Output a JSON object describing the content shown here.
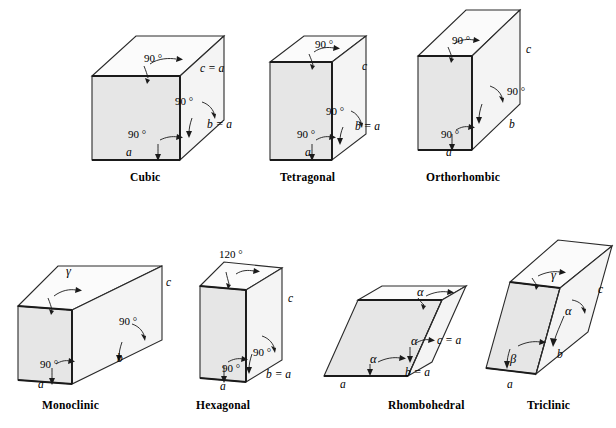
{
  "figure": {
    "background_color": "#ffffff",
    "line_color": "#2a2a2a",
    "front_face_color": "#e6e6e6",
    "top_face_color": "#fbfbfb",
    "side_face_color": "#f4f4f4"
  },
  "systems": [
    {
      "id": "cubic",
      "caption": "Cubic",
      "annotations": [
        {
          "name": "angle-top",
          "text": "90 °"
        },
        {
          "name": "angle-right",
          "text": "90 °"
        },
        {
          "name": "angle-front",
          "text": "90 °"
        },
        {
          "name": "axis-a",
          "text": "a"
        },
        {
          "name": "axis-b",
          "text": "b = a"
        },
        {
          "name": "axis-c",
          "text": "c = a"
        }
      ]
    },
    {
      "id": "tetragonal",
      "caption": "Tetragonal",
      "annotations": [
        {
          "name": "angle-top",
          "text": "90 °"
        },
        {
          "name": "angle-right",
          "text": "90 °"
        },
        {
          "name": "angle-front",
          "text": "90 °"
        },
        {
          "name": "axis-a",
          "text": "a"
        },
        {
          "name": "axis-b",
          "text": "b = a"
        },
        {
          "name": "axis-c",
          "text": "c"
        }
      ]
    },
    {
      "id": "orthorhombic",
      "caption": "Orthorhombic",
      "annotations": [
        {
          "name": "angle-top",
          "text": "90 °"
        },
        {
          "name": "angle-right",
          "text": "90 °"
        },
        {
          "name": "angle-front",
          "text": "90 °"
        },
        {
          "name": "axis-a",
          "text": "a"
        },
        {
          "name": "axis-b",
          "text": "b"
        },
        {
          "name": "axis-c",
          "text": "c"
        }
      ]
    },
    {
      "id": "monoclinic",
      "caption": "Monoclinic",
      "annotations": [
        {
          "name": "angle-top-gamma",
          "text": "γ"
        },
        {
          "name": "angle-right",
          "text": "90 °"
        },
        {
          "name": "angle-front",
          "text": "90 °"
        },
        {
          "name": "axis-a",
          "text": "a"
        },
        {
          "name": "axis-b",
          "text": "b"
        },
        {
          "name": "axis-c",
          "text": "c"
        }
      ]
    },
    {
      "id": "hexagonal",
      "caption": "Hexagonal",
      "annotations": [
        {
          "name": "angle-top",
          "text": "120 °"
        },
        {
          "name": "angle-right",
          "text": "90 °"
        },
        {
          "name": "angle-front",
          "text": "90 °"
        },
        {
          "name": "axis-a",
          "text": "a"
        },
        {
          "name": "axis-b",
          "text": "b = a"
        },
        {
          "name": "axis-c",
          "text": "c"
        }
      ]
    },
    {
      "id": "rhombohedral",
      "caption": "Rhombohedral",
      "annotations": [
        {
          "name": "angle-top-alpha",
          "text": "α"
        },
        {
          "name": "angle-mid-alpha",
          "text": "α"
        },
        {
          "name": "angle-front-alpha",
          "text": "α"
        },
        {
          "name": "axis-a",
          "text": "a"
        },
        {
          "name": "axis-b",
          "text": "b = a"
        },
        {
          "name": "axis-c",
          "text": "c = a"
        }
      ]
    },
    {
      "id": "triclinic",
      "caption": "Triclinic",
      "annotations": [
        {
          "name": "angle-top-gamma",
          "text": "γ"
        },
        {
          "name": "angle-right-alpha",
          "text": "α"
        },
        {
          "name": "angle-front-beta",
          "text": "β"
        },
        {
          "name": "axis-a",
          "text": "a"
        },
        {
          "name": "axis-b",
          "text": "b"
        },
        {
          "name": "axis-c",
          "text": "c"
        }
      ]
    }
  ]
}
